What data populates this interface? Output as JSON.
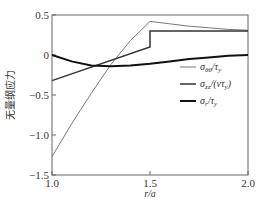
{
  "chart_data": {
    "type": "line",
    "title": "",
    "xlabel": "r/a",
    "ylabel": "无量纲应力",
    "xlim": [
      1.0,
      2.0
    ],
    "ylim": [
      -1.5,
      0.5
    ],
    "xticks": [
      "1.0",
      "1.5",
      "2.0"
    ],
    "yticks": [
      "0.5",
      "0",
      "-0.5",
      "-1.0",
      "-1.5"
    ],
    "grid": false,
    "legend_position": "right-middle",
    "series": [
      {
        "name": "σθθ/τy",
        "color": "#777777",
        "width": 1,
        "x": [
          1.0,
          1.1,
          1.2,
          1.3,
          1.4,
          1.5,
          1.6,
          1.7,
          1.8,
          1.9,
          2.0
        ],
        "y": [
          -1.27,
          -0.86,
          -0.48,
          -0.12,
          0.18,
          0.42,
          0.39,
          0.36,
          0.34,
          0.32,
          0.31
        ]
      },
      {
        "name": "σzz/(ντy)",
        "color": "#333333",
        "width": 1.5,
        "x": [
          1.0,
          1.5,
          1.5,
          2.0
        ],
        "y": [
          -0.32,
          0.1,
          0.3,
          0.3
        ]
      },
      {
        "name": "σr/τy",
        "color": "#111111",
        "width": 2,
        "x": [
          1.0,
          1.1,
          1.2,
          1.3,
          1.4,
          1.5,
          1.6,
          1.7,
          1.8,
          1.9,
          2.0
        ],
        "y": [
          0.0,
          -0.08,
          -0.13,
          -0.14,
          -0.13,
          -0.11,
          -0.08,
          -0.05,
          -0.03,
          -0.01,
          0.0
        ]
      }
    ]
  },
  "legend": [
    {
      "label": "σθθ/τy",
      "main": "σ",
      "sub": "θθ",
      "rest": "/τ",
      "rest_sub": "y"
    },
    {
      "label": "σzz/(ντy)",
      "main": "σ",
      "sub": "zz",
      "rest": "/(ντ",
      "rest_sub": "y",
      "tail": ")"
    },
    {
      "label": "σr/τy",
      "main": "σ",
      "sub": "r",
      "rest": "/τ",
      "rest_sub": "y"
    }
  ]
}
